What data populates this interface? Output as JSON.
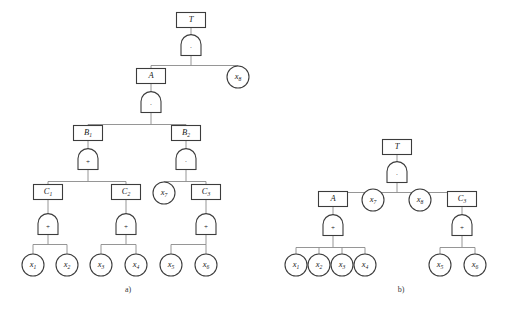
{
  "figure": {
    "type": "fault-tree",
    "captions": [
      {
        "id": "caption-a",
        "text": "a)",
        "x": 128,
        "y": 292
      },
      {
        "id": "caption-b",
        "text": "b)",
        "x": 401,
        "y": 292
      }
    ]
  },
  "symbols": {
    "and_gate": "·",
    "or_gate": "+"
  },
  "tree_a": {
    "name": "a",
    "boxes": [
      {
        "id": "a-box-T",
        "label": "T",
        "sub": "",
        "cx": 191,
        "cy": 20
      },
      {
        "id": "a-box-A",
        "label": "A",
        "sub": "",
        "cx": 151,
        "cy": 76
      },
      {
        "id": "a-box-B1",
        "label": "B",
        "sub": "1",
        "cx": 88,
        "cy": 133
      },
      {
        "id": "a-box-B2",
        "label": "B",
        "sub": "2",
        "cx": 186,
        "cy": 133
      },
      {
        "id": "a-box-C1",
        "label": "C",
        "sub": "1",
        "cx": 48,
        "cy": 192
      },
      {
        "id": "a-box-C2",
        "label": "C",
        "sub": "2",
        "cx": 126,
        "cy": 192
      },
      {
        "id": "a-box-C3",
        "label": "C",
        "sub": "3",
        "cx": 206,
        "cy": 192
      }
    ],
    "gates": [
      {
        "id": "a-gate-T",
        "type": "and",
        "symbol": "·",
        "cx": 191,
        "cy": 46
      },
      {
        "id": "a-gate-A",
        "type": "and",
        "symbol": "·",
        "cx": 151,
        "cy": 103
      },
      {
        "id": "a-gate-B1",
        "type": "or",
        "symbol": "+",
        "cx": 88,
        "cy": 160
      },
      {
        "id": "a-gate-B2",
        "type": "and",
        "symbol": "·",
        "cx": 186,
        "cy": 160
      },
      {
        "id": "a-gate-C1",
        "type": "or",
        "symbol": "+",
        "cx": 48,
        "cy": 225
      },
      {
        "id": "a-gate-C2",
        "type": "or",
        "symbol": "+",
        "cx": 126,
        "cy": 225
      },
      {
        "id": "a-gate-C3",
        "type": "or",
        "symbol": "+",
        "cx": 206,
        "cy": 225
      }
    ],
    "events": [
      {
        "id": "a-evt-x8",
        "label": "x",
        "sub": "8",
        "cx": 238,
        "cy": 77
      },
      {
        "id": "a-evt-x7",
        "label": "x",
        "sub": "7",
        "cx": 164,
        "cy": 193
      },
      {
        "id": "a-evt-x1",
        "label": "x",
        "sub": "1",
        "cx": 33,
        "cy": 265
      },
      {
        "id": "a-evt-x2",
        "label": "x",
        "sub": "2",
        "cx": 67,
        "cy": 265
      },
      {
        "id": "a-evt-x3",
        "label": "x",
        "sub": "3",
        "cx": 101,
        "cy": 265
      },
      {
        "id": "a-evt-x4",
        "label": "x",
        "sub": "4",
        "cx": 136,
        "cy": 265
      },
      {
        "id": "a-evt-x5",
        "label": "x",
        "sub": "5",
        "cx": 171,
        "cy": 265
      },
      {
        "id": "a-evt-x6",
        "label": "x",
        "sub": "6",
        "cx": 206,
        "cy": 265
      }
    ]
  },
  "tree_b": {
    "name": "b",
    "boxes": [
      {
        "id": "b-box-T",
        "label": "T",
        "sub": "",
        "cx": 397,
        "cy": 147
      },
      {
        "id": "b-box-A",
        "label": "A",
        "sub": "",
        "cx": 333,
        "cy": 199
      },
      {
        "id": "b-box-C3",
        "label": "C",
        "sub": "3",
        "cx": 462,
        "cy": 199
      }
    ],
    "gates": [
      {
        "id": "b-gate-T",
        "type": "and",
        "symbol": "·",
        "cx": 397,
        "cy": 173
      },
      {
        "id": "b-gate-A",
        "type": "or",
        "symbol": "+",
        "cx": 333,
        "cy": 226
      },
      {
        "id": "b-gate-C3",
        "type": "or",
        "symbol": "+",
        "cx": 462,
        "cy": 226
      }
    ],
    "events": [
      {
        "id": "b-evt-x7",
        "label": "x",
        "sub": "7",
        "cx": 373,
        "cy": 200
      },
      {
        "id": "b-evt-x8",
        "label": "x",
        "sub": "8",
        "cx": 420,
        "cy": 200
      },
      {
        "id": "b-evt-x1",
        "label": "x",
        "sub": "1",
        "cx": 296,
        "cy": 265
      },
      {
        "id": "b-evt-x2",
        "label": "x",
        "sub": "2",
        "cx": 319,
        "cy": 265
      },
      {
        "id": "b-evt-x3",
        "label": "x",
        "sub": "3",
        "cx": 342,
        "cy": 265
      },
      {
        "id": "b-evt-x4",
        "label": "x",
        "sub": "4",
        "cx": 365,
        "cy": 265
      },
      {
        "id": "b-evt-x5",
        "label": "x",
        "sub": "5",
        "cx": 440,
        "cy": 265
      },
      {
        "id": "b-evt-x6",
        "label": "x",
        "sub": "6",
        "cx": 475,
        "cy": 265
      }
    ]
  }
}
